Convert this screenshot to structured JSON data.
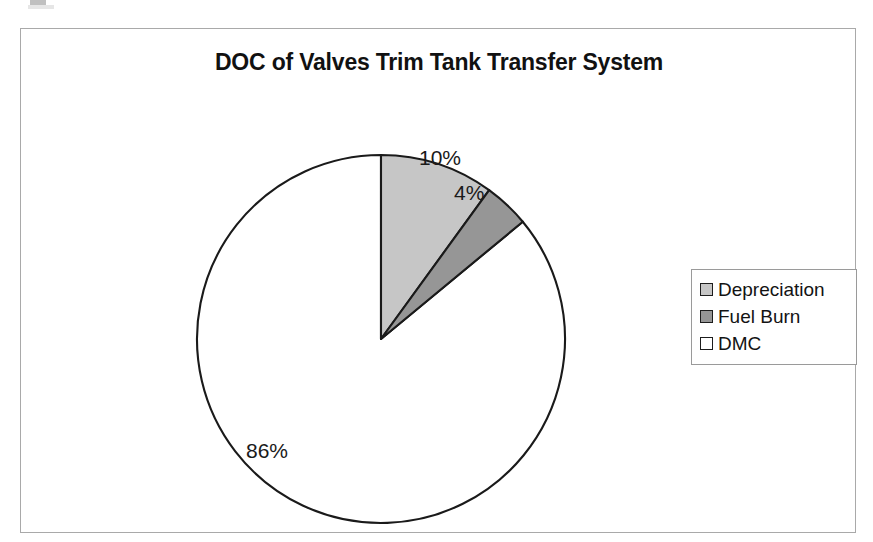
{
  "chart_data": {
    "type": "pie",
    "title": "DOC of Valves Trim Tank Transfer System",
    "categories": [
      "Depreciation",
      "Fuel Burn",
      "DMC"
    ],
    "values": [
      10,
      4,
      86
    ],
    "value_labels": [
      "10%",
      "4%",
      "86%"
    ],
    "units": "percent",
    "start_angle_deg": 0,
    "direction": "clockwise",
    "colors": [
      "#c6c6c6",
      "#969696",
      "#ffffff"
    ],
    "slice_outline_color": "#1a1a1a",
    "legend_position": "right",
    "grid": false,
    "xlabel": "",
    "ylabel": ""
  },
  "frame": {
    "border_color": "#a9a9a9",
    "background": "#ffffff"
  },
  "title": {
    "text": "DOC of Valves Trim Tank Transfer System"
  },
  "labels": {
    "depreciation": "10%",
    "fuel_burn": "4%",
    "dmc": "86%"
  },
  "legend": {
    "items": [
      {
        "label": "Depreciation",
        "color": "#c6c6c6"
      },
      {
        "label": "Fuel Burn",
        "color": "#969696"
      },
      {
        "label": "DMC",
        "color": "#ffffff"
      }
    ]
  }
}
